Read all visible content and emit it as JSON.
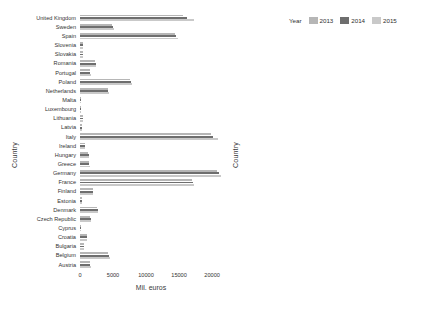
{
  "legend": {
    "title": "Year",
    "entries": [
      {
        "label": "2013",
        "color": "#b6b6b6"
      },
      {
        "label": "2014",
        "color": "#6e6e6e"
      },
      {
        "label": "2015",
        "color": "#c9c9c9"
      }
    ]
  },
  "axis_titles": {
    "y": "Country",
    "x_left": "Mil. euros",
    "x_right": "Percentage"
  },
  "chart_data": [
    {
      "type": "bar",
      "orientation": "horizontal",
      "title": "",
      "xlabel": "Mil. euros",
      "ylabel": "Country",
      "xlim": [
        0,
        21500
      ],
      "xticks": [
        0,
        5000,
        10000,
        15000,
        20000
      ],
      "xticklabels": [
        "0",
        "5000",
        "10000",
        "15000",
        "20000"
      ],
      "grid": false,
      "legend_position": "top-right-shared",
      "categories": [
        "United Kingdom",
        "Sweden",
        "Spain",
        "Slovenia",
        "Slovakia",
        "Romania",
        "Portugal",
        "Poland",
        "Netherlands",
        "Malta",
        "Luxembourg",
        "Lithuania",
        "Latvia",
        "Italy",
        "Ireland",
        "Hungary",
        "Greece",
        "Germany",
        "France",
        "Finland",
        "Estonia",
        "Denmark",
        "Czech Republic",
        "Cyprus",
        "Croatia",
        "Bulgaria",
        "Belgium",
        "Austria"
      ],
      "series": [
        {
          "name": "2013",
          "values": [
            15600,
            4900,
            14400,
            450,
            430,
            2250,
            1500,
            7500,
            4200,
            90,
            110,
            440,
            320,
            19800,
            700,
            1250,
            1350,
            20700,
            16900,
            1900,
            230,
            2550,
            1550,
            110,
            1000,
            560,
            4300,
            1500
          ]
        },
        {
          "name": "2014",
          "values": [
            16200,
            5000,
            14600,
            470,
            450,
            2350,
            1550,
            7700,
            4300,
            95,
            115,
            470,
            340,
            20200,
            730,
            1300,
            1400,
            21000,
            17100,
            1950,
            245,
            2650,
            1600,
            115,
            1060,
            590,
            4400,
            1550
          ]
        },
        {
          "name": "2015",
          "values": [
            17200,
            5100,
            14800,
            490,
            470,
            2450,
            1600,
            7900,
            4400,
            100,
            120,
            500,
            360,
            20900,
            760,
            1350,
            1450,
            21400,
            17300,
            2000,
            260,
            2750,
            1650,
            120,
            1120,
            620,
            4500,
            1600
          ]
        }
      ]
    },
    {
      "type": "bar",
      "orientation": "horizontal",
      "title": "",
      "xlabel": "Percentage",
      "ylabel": "Country",
      "xlim": [
        0,
        33
      ],
      "xticks": [
        0,
        10,
        20,
        30
      ],
      "xticklabels": [
        "0",
        "10",
        "20",
        "30"
      ],
      "grid": false,
      "legend_position": "top-right-shared",
      "categories": [
        "United Kingdom",
        "Sweden",
        "Spain",
        "Slovenia",
        "Slovakia",
        "Romania",
        "Portugal",
        "Poland",
        "Netherlands",
        "Malta",
        "Luxembourg",
        "Lithuania",
        "Latvia",
        "Italy",
        "Ireland",
        "Hungary",
        "Greece",
        "Germany",
        "France",
        "Finland",
        "Estonia",
        "Denmark",
        "Czech Republic",
        "Cyprus",
        "Croatia",
        "Bulgaria",
        "Belgium",
        "Austria"
      ],
      "series": [
        {
          "name": "2013",
          "values": [
            12.6,
            17.3,
            21.0,
            28.0,
            17.4,
            31.8,
            24.5,
            26.2,
            12.9,
            28.4,
            11.2,
            29.6,
            28.0,
            21.8,
            12.3,
            22.0,
            23.8,
            12.2,
            11.1,
            13.0,
            27.3,
            12.9,
            15.6,
            27.7,
            29.0,
            31.7,
            16.4,
            8.0
          ]
        },
        {
          "name": "2014",
          "values": [
            12.8,
            17.5,
            21.2,
            28.2,
            17.6,
            32.0,
            24.7,
            26.4,
            13.0,
            28.6,
            11.3,
            29.8,
            28.2,
            22.0,
            12.4,
            22.2,
            24.0,
            12.3,
            11.2,
            13.1,
            27.5,
            13.0,
            15.8,
            27.9,
            29.2,
            31.9,
            16.5,
            8.1
          ]
        },
        {
          "name": "2015",
          "values": [
            13.0,
            17.7,
            21.4,
            28.4,
            17.8,
            32.2,
            24.9,
            26.6,
            13.1,
            28.8,
            11.4,
            30.0,
            28.4,
            22.2,
            12.5,
            22.4,
            24.2,
            12.4,
            11.3,
            13.2,
            27.7,
            13.1,
            16.0,
            28.1,
            29.4,
            32.1,
            16.6,
            8.2
          ]
        }
      ]
    }
  ]
}
